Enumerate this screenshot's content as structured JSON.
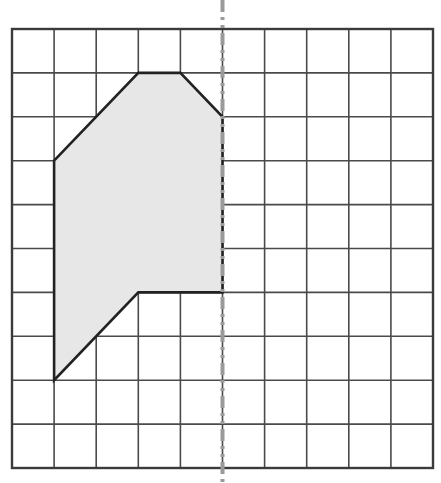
{
  "figure": {
    "type": "geometry-grid-diagram",
    "canvas": {
      "width": 441,
      "height": 483
    },
    "background_color": "#ffffff"
  },
  "grid": {
    "name": "square-grid",
    "columns": 10,
    "rows": 10,
    "origin_x": 12,
    "origin_y": 29,
    "cell_width": 42.1,
    "cell_height": 43.9,
    "line_color": "#4a4a4a",
    "line_width": 1.6,
    "border_color": "#3b3b3b",
    "border_width": 2.4,
    "x_lines": [
      12,
      54.1,
      96.2,
      138.3,
      180.4,
      222.5,
      264.6,
      306.7,
      348.8,
      390.9,
      433
    ],
    "y_lines": [
      29,
      72.9,
      116.8,
      160.7,
      204.6,
      248.5,
      292.4,
      336.3,
      380.2,
      424.1,
      468
    ]
  },
  "mirror_line": {
    "name": "line-of-symmetry",
    "label": "",
    "orientation": "vertical",
    "grid_column": 5,
    "x_pixel": 222.5,
    "y_start": 0,
    "y_end": 483,
    "color": "#9a9a9a",
    "line_width": 4,
    "dash_pattern": "12 5 3 5 3 5",
    "style": "dash-dot-dot"
  },
  "shape": {
    "name": "shaded-polygon",
    "fill_color": "#e7e7e7",
    "stroke_color": "#222222",
    "stroke_width": 2.6,
    "vertices_grid": [
      [
        1,
        3
      ],
      [
        3,
        1
      ],
      [
        4,
        1
      ],
      [
        5,
        2
      ],
      [
        5,
        6
      ],
      [
        3,
        6
      ],
      [
        1,
        8
      ]
    ],
    "vertices_pixels": [
      [
        54.1,
        160.7
      ],
      [
        138.3,
        72.9
      ],
      [
        180.4,
        72.9
      ],
      [
        222.5,
        116.8
      ],
      [
        222.5,
        292.4
      ],
      [
        138.3,
        292.4
      ],
      [
        54.1,
        380.2
      ]
    ],
    "closed": true,
    "edge_count": 7
  },
  "accessibility": {
    "description": "A light grey shaded polygon drawn on a 10 by 10 square grid. Its right-hand edge lies along a vertical dash-dot line of symmetry that runs the full height of the image."
  }
}
